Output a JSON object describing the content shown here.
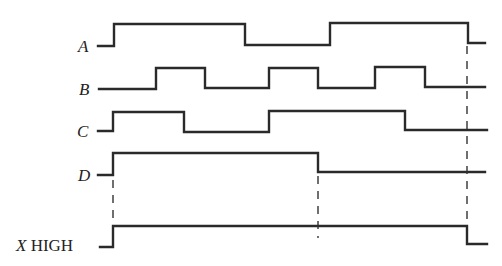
{
  "diagram": {
    "type": "timing-diagram",
    "signals": [
      {
        "name": "A",
        "label": "A",
        "label_italic": true,
        "low_y": 46,
        "high_y": 24,
        "path": "M98 46 L114 46 L114 24 L245 24 L245 45 L330 45 L330 23 L468 23 L468 43 L485 43",
        "transitions_x": [
          114,
          245,
          330,
          468
        ]
      },
      {
        "name": "B",
        "label": "B",
        "label_italic": true,
        "low_y": 89,
        "high_y": 68,
        "path": "M99 89 L156 89 L156 68 L205 68 L205 88 L269 88 L269 68 L318 68 L318 88 L375 88 L375 67 L425 67 L425 87 L485 87",
        "transitions_x": [
          156,
          205,
          269,
          318,
          375,
          425
        ]
      },
      {
        "name": "C",
        "label": "C",
        "label_italic": true,
        "low_y": 131,
        "high_y": 112,
        "path": "M98 131 L113 131 L113 112 L184 112 L184 132 L269 132 L269 111 L405 111 L405 130 L487 130",
        "transitions_x": [
          113,
          184,
          269,
          405
        ]
      },
      {
        "name": "D",
        "label": "D",
        "label_italic": true,
        "low_y": 175,
        "high_y": 153,
        "path": "M98 175 L113 175 L113 153 L318 153 L318 172 L485 172",
        "transitions_x": [
          113,
          318
        ]
      },
      {
        "name": "X",
        "label_var": "X",
        "label_suffix": " HIGH",
        "low_y": 247,
        "high_y": 226,
        "path": "M100 247 L113 247 L113 226 L467 226 L467 244 L487 244",
        "transitions_x": [
          113,
          467
        ]
      }
    ],
    "dashed_markers": [
      {
        "x": 113,
        "y1": 180,
        "y2": 222
      },
      {
        "x": 318,
        "y1": 176,
        "y2": 238
      },
      {
        "x": 467,
        "y1": 46,
        "y2": 222
      }
    ]
  }
}
